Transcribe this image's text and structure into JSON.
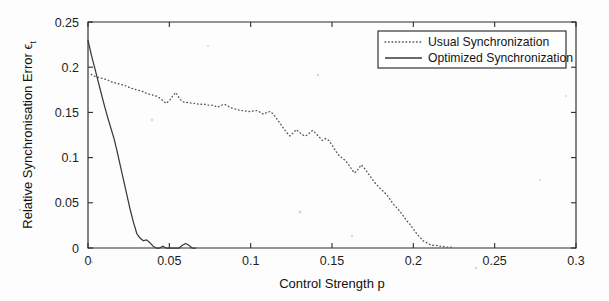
{
  "chart_data": {
    "type": "line",
    "title": "",
    "xlabel": "Control Strength p",
    "ylabel": "Relative Synchronisation Error ϵₜ",
    "ylabel_base": "Relative Synchronisation Error",
    "ylabel_symbol": "ϵ",
    "ylabel_symbol_subscript": "t",
    "xlim": [
      0,
      0.3
    ],
    "ylim": [
      0,
      0.25
    ],
    "grid": false,
    "legend_position": "top-right",
    "xticks": [
      0,
      0.05,
      0.1,
      0.15,
      0.2,
      0.25,
      0.3
    ],
    "xticklabels": [
      "0",
      "0.05",
      "0.1",
      "0.15",
      "0.2",
      "0.25",
      "0.3"
    ],
    "yticks": [
      0,
      0.05,
      0.1,
      0.15,
      0.2,
      0.25
    ],
    "yticklabels": [
      "0",
      "0.05",
      "0.1",
      "0.15",
      "0.2",
      "0.25"
    ],
    "series": [
      {
        "name": "Usual Synchronization",
        "style": "dotted",
        "color": "#555555",
        "x": [
          0.002,
          0.004,
          0.006,
          0.008,
          0.01,
          0.012,
          0.014,
          0.016,
          0.018,
          0.02,
          0.022,
          0.024,
          0.026,
          0.028,
          0.03,
          0.032,
          0.034,
          0.036,
          0.038,
          0.04,
          0.042,
          0.044,
          0.046,
          0.048,
          0.05,
          0.052,
          0.054,
          0.056,
          0.058,
          0.06,
          0.062,
          0.064,
          0.066,
          0.068,
          0.07,
          0.072,
          0.074,
          0.076,
          0.078,
          0.08,
          0.082,
          0.084,
          0.086,
          0.088,
          0.09,
          0.092,
          0.094,
          0.096,
          0.098,
          0.1,
          0.102,
          0.104,
          0.106,
          0.108,
          0.11,
          0.112,
          0.114,
          0.116,
          0.118,
          0.12,
          0.122,
          0.124,
          0.126,
          0.128,
          0.13,
          0.132,
          0.134,
          0.136,
          0.138,
          0.14,
          0.142,
          0.144,
          0.146,
          0.148,
          0.15,
          0.152,
          0.154,
          0.156,
          0.158,
          0.16,
          0.162,
          0.164,
          0.166,
          0.168,
          0.17,
          0.172,
          0.174,
          0.176,
          0.178,
          0.18,
          0.182,
          0.184,
          0.186,
          0.188,
          0.19,
          0.192,
          0.194,
          0.196,
          0.198,
          0.2,
          0.202,
          0.204,
          0.206,
          0.208,
          0.21,
          0.212,
          0.214,
          0.216,
          0.218,
          0.22,
          0.222,
          0.224
        ],
        "y": [
          0.192,
          0.19,
          0.189,
          0.188,
          0.187,
          0.186,
          0.184,
          0.183,
          0.182,
          0.181,
          0.18,
          0.179,
          0.177,
          0.176,
          0.175,
          0.174,
          0.173,
          0.171,
          0.17,
          0.169,
          0.168,
          0.166,
          0.163,
          0.16,
          0.163,
          0.168,
          0.172,
          0.166,
          0.162,
          0.161,
          0.161,
          0.16,
          0.16,
          0.159,
          0.159,
          0.159,
          0.158,
          0.158,
          0.157,
          0.156,
          0.158,
          0.159,
          0.157,
          0.155,
          0.154,
          0.153,
          0.152,
          0.152,
          0.151,
          0.151,
          0.152,
          0.152,
          0.15,
          0.148,
          0.15,
          0.151,
          0.148,
          0.143,
          0.138,
          0.133,
          0.128,
          0.124,
          0.127,
          0.131,
          0.128,
          0.125,
          0.124,
          0.127,
          0.13,
          0.127,
          0.123,
          0.119,
          0.121,
          0.119,
          0.114,
          0.108,
          0.103,
          0.1,
          0.097,
          0.093,
          0.087,
          0.083,
          0.087,
          0.092,
          0.088,
          0.083,
          0.078,
          0.073,
          0.069,
          0.065,
          0.062,
          0.058,
          0.053,
          0.048,
          0.044,
          0.04,
          0.035,
          0.03,
          0.026,
          0.021,
          0.016,
          0.012,
          0.008,
          0.006,
          0.004,
          0.003,
          0.003,
          0.002,
          0.002,
          0.001,
          0.001,
          0.001
        ]
      },
      {
        "name": "Optimized Synchronization",
        "style": "solid",
        "color": "#3a3a3a",
        "x": [
          0.0,
          0.002,
          0.004,
          0.006,
          0.008,
          0.01,
          0.012,
          0.014,
          0.016,
          0.018,
          0.02,
          0.022,
          0.024,
          0.026,
          0.028,
          0.03,
          0.032,
          0.034,
          0.036,
          0.038,
          0.04,
          0.042,
          0.044,
          0.046,
          0.048,
          0.05,
          0.052,
          0.054,
          0.056,
          0.058,
          0.06,
          0.062,
          0.064,
          0.066
        ],
        "y": [
          0.23,
          0.214,
          0.2,
          0.186,
          0.172,
          0.158,
          0.145,
          0.133,
          0.121,
          0.106,
          0.09,
          0.074,
          0.058,
          0.042,
          0.028,
          0.016,
          0.011,
          0.008,
          0.009,
          0.006,
          0.002,
          0.0,
          0.0,
          0.002,
          0.0,
          0.0,
          0.0,
          0.0,
          0.0,
          0.003,
          0.005,
          0.003,
          0.0,
          0.0
        ]
      }
    ]
  },
  "legend": {
    "entries": [
      {
        "label": "Usual Synchronization",
        "style": "dotted"
      },
      {
        "label": "Optimized Synchronization",
        "style": "solid"
      }
    ]
  }
}
